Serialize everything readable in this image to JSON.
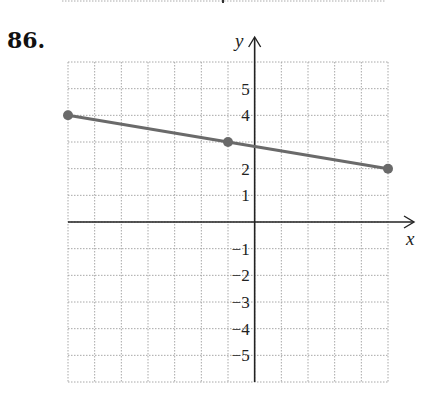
{
  "problem_number": "86.",
  "chart_data": {
    "type": "line",
    "title": "",
    "xlabel": "x",
    "ylabel": "y",
    "xlim": [
      -7,
      5
    ],
    "ylim": [
      -6,
      6
    ],
    "grid": true,
    "legend": null,
    "y_tick_labels": [
      "5",
      "4",
      "2",
      "1",
      "-1",
      "-2",
      "-3",
      "-4",
      "-5"
    ],
    "y_tick_values": [
      5,
      4,
      2,
      1,
      -1,
      -2,
      -3,
      -4,
      -5
    ],
    "x_tick_labels": [],
    "series": [
      {
        "name": "segment",
        "points": [
          {
            "x": -7,
            "y": 4
          },
          {
            "x": -1,
            "y": 3
          },
          {
            "x": 5,
            "y": 2
          }
        ],
        "marked_points": [
          {
            "x": -7,
            "y": 4
          },
          {
            "x": -1,
            "y": 3
          },
          {
            "x": 5,
            "y": 2
          }
        ],
        "color": "#6a6a6a"
      }
    ]
  }
}
